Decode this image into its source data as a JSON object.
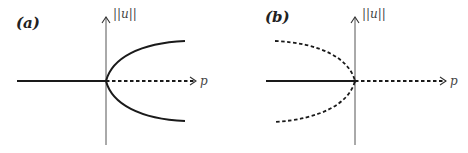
{
  "figure": {
    "panels": [
      {
        "id": "a",
        "label": "(a)",
        "y_axis_label": "||u||",
        "x_axis_label": "p",
        "description": "Supercritical pitchfork: solid trivial branch for p<0, dashed (unstable) trivial branch for p>0, solid (stable) parabolic branches opening to the right"
      },
      {
        "id": "b",
        "label": "(b)",
        "y_axis_label": "||u||",
        "x_axis_label": "p",
        "description": "Subcritical pitchfork: solid trivial branch for p<0, dashed trivial branch for p>0, dashed (unstable) parabolic branches opening to the left"
      }
    ],
    "colors": {
      "curve": "#1a1a1a",
      "axis": "#555555",
      "background": "#ffffff"
    }
  }
}
